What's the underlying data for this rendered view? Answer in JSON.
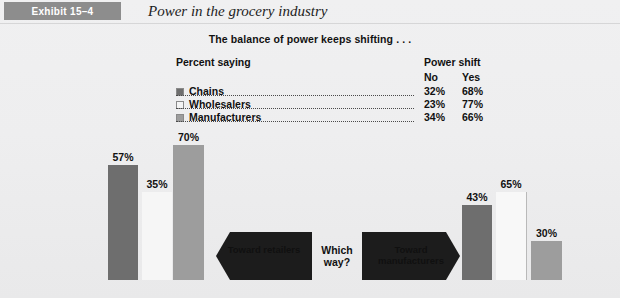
{
  "header": {
    "exhibit_label": "Exhibit 15–4",
    "title": "Power in the grocery industry"
  },
  "subtitle": "The balance of power keeps shifting . . .",
  "legend": {
    "percent_saying_label": "Percent saying",
    "power_shift_label": "Power shift",
    "col_no": "No",
    "col_yes": "Yes",
    "rows": [
      {
        "label": "Chains",
        "no": "32%",
        "yes": "68%",
        "color": "#6e6e6e"
      },
      {
        "label": "Wholesalers",
        "no": "23%",
        "yes": "77%",
        "color": "#f4f4f4"
      },
      {
        "label": "Manufacturers",
        "no": "34%",
        "yes": "66%",
        "color": "#9d9d9d"
      }
    ]
  },
  "arrows": {
    "left_label": "Toward retailers",
    "right_label": "Toward manufacturers",
    "center_label": "Which way?"
  },
  "chart_data": {
    "type": "bar",
    "title": "The balance of power keeps shifting . . .",
    "xlabel": "",
    "ylabel": "Percent saying",
    "ylim": [
      0,
      100
    ],
    "grid": false,
    "legend_position": "top",
    "categories": [
      "Toward retailers",
      "Toward manufacturers"
    ],
    "series": [
      {
        "name": "Chains",
        "color": "#6e6e6e",
        "values": [
          57,
          43
        ]
      },
      {
        "name": "Wholesalers",
        "color": "#f4f4f4",
        "values": [
          35,
          65
        ]
      },
      {
        "name": "Manufacturers",
        "color": "#9d9d9d",
        "values": [
          70,
          30
        ]
      }
    ],
    "data_labels": {
      "left_group": [
        "57%",
        "35%",
        "70%"
      ],
      "right_group": [
        "43%",
        "65%",
        "30%"
      ]
    },
    "annotations": [
      "Which way?"
    ]
  },
  "bars": {
    "left": [
      {
        "label": "57%",
        "value": 57,
        "color": "#6e6e6e",
        "x": 108,
        "w": 30,
        "h": 115,
        "outline": false
      },
      {
        "label": "35%",
        "value": 35,
        "color": "#f6f6f6",
        "x": 142,
        "w": 30,
        "h": 88,
        "outline": false
      },
      {
        "label": "70%",
        "value": 70,
        "color": "#9d9d9d",
        "x": 173,
        "w": 31,
        "h": 135,
        "outline": false
      }
    ],
    "right": [
      {
        "label": "43%",
        "value": 43,
        "color": "#6e6e6e",
        "x": 462,
        "w": 30,
        "h": 75,
        "outline": false
      },
      {
        "label": "65%",
        "value": 65,
        "color": "#f8f8f8",
        "x": 496,
        "w": 30,
        "h": 88,
        "outline": true
      },
      {
        "label": "30%",
        "value": 30,
        "color": "#9d9d9d",
        "x": 531,
        "w": 31,
        "h": 39,
        "outline": false
      }
    ]
  }
}
